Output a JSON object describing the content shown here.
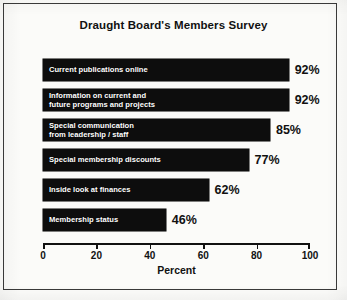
{
  "chart_data": {
    "type": "bar",
    "orientation": "horizontal",
    "title": "Draught Board's Members Survey",
    "xlabel": "Percent",
    "ylabel": "",
    "xlim": [
      0,
      100
    ],
    "xticks": [
      "0",
      "20",
      "40",
      "60",
      "80",
      "100"
    ],
    "grid": false,
    "legend": false,
    "bar_color": "#0d0d0d",
    "label_color": "#ffffff",
    "categories": [
      "Current publications online",
      "Information on current and\nfuture programs and projects",
      "Special communication\nfrom leadership / staff",
      "Special membership discounts",
      "Inside look at finances",
      "Membership status"
    ],
    "values": [
      92,
      92,
      85,
      77,
      62,
      46
    ],
    "value_labels": [
      "92%",
      "92%",
      "85%",
      "77%",
      "62%",
      "46%"
    ],
    "bars": [
      {
        "label": "Current publications online",
        "value": 92,
        "value_label": "92%"
      },
      {
        "label": "Information on current and\nfuture programs and projects",
        "value": 92,
        "value_label": "92%"
      },
      {
        "label": "Special communication\nfrom leadership / staff",
        "value": 85,
        "value_label": "85%"
      },
      {
        "label": "Special membership discounts",
        "value": 77,
        "value_label": "77%"
      },
      {
        "label": "Inside look at finances",
        "value": 62,
        "value_label": "62%"
      },
      {
        "label": "Membership status",
        "value": 46,
        "value_label": "46%"
      }
    ]
  }
}
